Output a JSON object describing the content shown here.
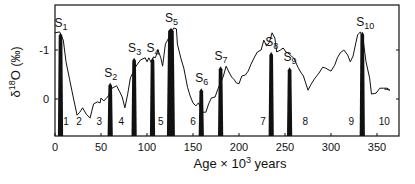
{
  "chart_data": {
    "type": "line",
    "title": "",
    "xlabel": "Age × 10³ years",
    "xlabel_parts": {
      "base": "Age × 10",
      "sup": "3",
      "tail": " years"
    },
    "ylabel": "δ18O (‰)",
    "ylabel_parts": {
      "delta": "δ",
      "sup": "18",
      "o": "O",
      "unit": "(‰)"
    },
    "xlim": [
      0,
      373
    ],
    "ylim": [
      0.75,
      -1.95
    ],
    "y_inverted": true,
    "grid": false,
    "legend": null,
    "x_ticks": [
      0,
      50,
      100,
      150,
      200,
      250,
      300,
      350
    ],
    "x_tick_labels": [
      "0",
      "50",
      "100",
      "150",
      "200",
      "250",
      "300",
      "350"
    ],
    "y_ticks": [
      -1,
      0
    ],
    "y_tick_labels": [
      "-1",
      "0"
    ],
    "series": [
      {
        "name": "δ18O record",
        "color": "#111111",
        "x": [
          0,
          5,
          9,
          12,
          16,
          20,
          24,
          27,
          30,
          34,
          38,
          42,
          46,
          49,
          50,
          53,
          57,
          60,
          62,
          67,
          70,
          73,
          76,
          79,
          82,
          88,
          93,
          98,
          100,
          102,
          105,
          107,
          109,
          112,
          115,
          117,
          120,
          126,
          129,
          132,
          133,
          137,
          140,
          144,
          147,
          150,
          153,
          156,
          159,
          160,
          164,
          167,
          170,
          174,
          177,
          180,
          183,
          186,
          189,
          192,
          195,
          197,
          200,
          203,
          207,
          210,
          213,
          217,
          220,
          224,
          227,
          230,
          233,
          236,
          239,
          241,
          245,
          248,
          251,
          253,
          257,
          260,
          264,
          267,
          270,
          275,
          278,
          282,
          287,
          291,
          294,
          300,
          304,
          307,
          310,
          314,
          318,
          321,
          324,
          327,
          329,
          332,
          335,
          338,
          342,
          344,
          349,
          353,
          357,
          361,
          364,
          360,
          358
        ],
        "y": [
          -1.35,
          -1.37,
          -1.2,
          -0.76,
          -0.39,
          -0.02,
          0.33,
          0.27,
          0.18,
          0.31,
          0.39,
          0.1,
          0.06,
          0.08,
          -0.02,
          0.04,
          -0.04,
          -0.12,
          -0.22,
          -0.27,
          -0.16,
          -0.04,
          0.18,
          -0.1,
          -0.43,
          -0.67,
          -0.8,
          -0.84,
          -0.76,
          -0.84,
          -0.73,
          -0.86,
          -0.84,
          -1.0,
          -0.84,
          -0.67,
          -1.12,
          -1.33,
          -1.45,
          -1.43,
          -1.12,
          -0.82,
          -0.63,
          -0.24,
          -0.06,
          0.08,
          0.14,
          0.08,
          0.22,
          0.27,
          0.27,
          0.1,
          -0.02,
          -0.04,
          -0.2,
          -0.33,
          -0.47,
          -0.67,
          -0.55,
          -0.45,
          -0.39,
          -0.33,
          -0.31,
          -0.47,
          -0.49,
          -0.57,
          -0.71,
          -0.86,
          -0.96,
          -1.0,
          -1.2,
          -1.08,
          -1.16,
          -1.35,
          -1.24,
          -0.96,
          -1.0,
          -1.04,
          -0.96,
          -0.94,
          -0.88,
          -0.82,
          -0.65,
          -0.55,
          -0.47,
          -0.18,
          -0.29,
          -0.41,
          -0.53,
          -0.65,
          -0.63,
          -0.57,
          -0.69,
          -0.84,
          -0.94,
          -1.0,
          -0.9,
          -0.76,
          -0.88,
          -1.14,
          -1.31,
          -1.37,
          -1.2,
          -0.76,
          -0.43,
          -0.1,
          -0.12,
          -0.22,
          -0.22,
          -0.22,
          -0.18,
          -0.2,
          -0.2
        ]
      }
    ],
    "peaks": [
      {
        "label": "S",
        "sub": "1",
        "age": 6,
        "delta": -1.35
      },
      {
        "label": "S",
        "sub": "2",
        "age": 60,
        "delta": -0.33
      },
      {
        "label": "S",
        "sub": "3",
        "age": 86,
        "delta": -0.84
      },
      {
        "label": "S",
        "sub": "4",
        "age": 106,
        "delta": -0.84
      },
      {
        "label": "S",
        "sub": "5",
        "age": 126,
        "delta": -1.45
      },
      {
        "label": "S",
        "sub": "6",
        "age": 159,
        "delta": -0.22
      },
      {
        "label": "S",
        "sub": "7",
        "age": 180,
        "delta": -0.67
      },
      {
        "label": "S",
        "sub": "8",
        "age": 235,
        "delta": -0.96
      },
      {
        "label": "S",
        "sub": "9",
        "age": 255,
        "delta": -0.65
      },
      {
        "label": "S",
        "sub": "10",
        "age": 334,
        "delta": -1.37
      }
    ],
    "stage_labels": [
      {
        "text": "1",
        "age": 12
      },
      {
        "text": "2",
        "age": 26
      },
      {
        "text": "3",
        "age": 48
      },
      {
        "text": "4",
        "age": 72
      },
      {
        "text": "5",
        "age": 115
      },
      {
        "text": "6",
        "age": 150
      },
      {
        "text": "7",
        "age": 226
      },
      {
        "text": "8",
        "age": 272
      },
      {
        "text": "9",
        "age": 322
      },
      {
        "text": "10",
        "age": 358
      }
    ],
    "annotations": "Black filled bars mark sampled interglacial peaks S1–S10; numerals 1–10 near base mark isotope stages."
  }
}
